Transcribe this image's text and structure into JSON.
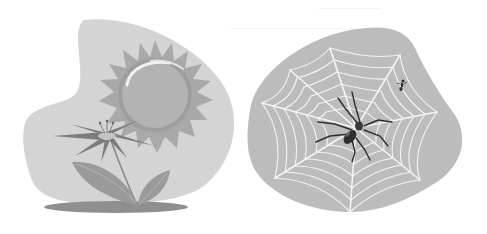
{
  "image": {
    "description": "Two grayscale clip-art illustrations on a white background",
    "palette": {
      "background": "#ffffff",
      "left_blob": "#d4d4d4",
      "right_blob": "#bcbcbc",
      "sun_rays": "#a9a9a9",
      "sun_body": "#b3b3b3",
      "sun_highlight": "#f2f2f2",
      "petals": "#7d7d7d",
      "leaves": "#9a9a9a",
      "shadow": "#8f8f8f",
      "web": "#f4f4f4",
      "spider": "#2e2e2e"
    }
  },
  "panels": [
    {
      "name": "sun-and-flower",
      "label": "Sun and flower illustration"
    },
    {
      "name": "spider-web",
      "label": "Spider on web illustration"
    }
  ]
}
